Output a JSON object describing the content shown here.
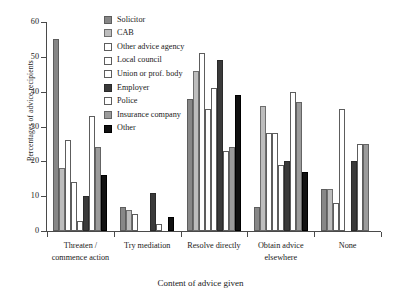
{
  "chart_data": {
    "type": "bar",
    "title": "",
    "xlabel": "Content of advice given",
    "ylabel": "Percentages of advice recipients",
    "ylim": [
      0,
      60
    ],
    "yticks": [
      0,
      10,
      20,
      30,
      40,
      50,
      60
    ],
    "grid": false,
    "legend_position": "top-center",
    "categories": [
      "Threaten / commence action",
      "Try mediation",
      "Resolve directly",
      "Obtain advice elsewhere",
      "None"
    ],
    "category_lines": [
      [
        "Threaten /",
        "commence action"
      ],
      [
        "Try mediation",
        ""
      ],
      [
        "Resolve directly",
        ""
      ],
      [
        "Obtain advice",
        "elsewhere"
      ],
      [
        "None",
        ""
      ]
    ],
    "series": [
      {
        "name": "Solicitor",
        "color": "#878787",
        "values": [
          55,
          7,
          38,
          7,
          12
        ]
      },
      {
        "name": "CAB",
        "color": "#bdbdbd",
        "values": [
          18,
          6,
          46,
          36,
          12
        ]
      },
      {
        "name": "Other advice agency",
        "color": "#ffffff",
        "values": [
          26,
          5,
          51,
          28,
          8
        ]
      },
      {
        "name": "Local council",
        "color": "#ffffff",
        "values": [
          14,
          0,
          35,
          28,
          35
        ]
      },
      {
        "name": "Union or prof. body",
        "color": "#ffffff",
        "values": [
          3,
          0,
          41,
          19,
          0
        ]
      },
      {
        "name": "Employer",
        "color": "#3a3a3a",
        "values": [
          10,
          11,
          49,
          20,
          20
        ]
      },
      {
        "name": "Police",
        "color": "#ffffff",
        "values": [
          33,
          2,
          23,
          40,
          25
        ]
      },
      {
        "name": "Insurance company",
        "color": "#9b9b9b",
        "values": [
          24,
          0,
          24,
          37,
          25
        ]
      },
      {
        "name": "Other",
        "color": "#111111",
        "values": [
          16,
          4,
          39,
          17,
          0
        ]
      }
    ]
  },
  "legend": {
    "items": [
      {
        "label": "Solicitor",
        "swatch": "solicitor"
      },
      {
        "label": "CAB",
        "swatch": "cab"
      },
      {
        "label": "Other advice agency",
        "swatch": "otheradv"
      },
      {
        "label": "Local council",
        "swatch": "council"
      },
      {
        "label": "Union or prof. body",
        "swatch": "union"
      },
      {
        "label": "Employer",
        "swatch": "employer"
      },
      {
        "label": "Police",
        "swatch": "police"
      },
      {
        "label": "Insurance company",
        "swatch": "insurance"
      },
      {
        "label": "Other",
        "swatch": "other"
      }
    ]
  }
}
